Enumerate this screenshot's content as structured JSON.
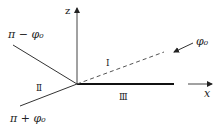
{
  "diagram": {
    "axes": {
      "z_label": "z",
      "x_label": "x"
    },
    "angle_labels": {
      "upper_left": "π − φ₀",
      "lower_left": "π + φ₀",
      "incident": "φ₀"
    },
    "regions": {
      "one": "Ⅰ",
      "two": "Ⅱ",
      "three": "Ⅲ"
    },
    "colors": {
      "line": "#222222",
      "text": "#222222",
      "dashed": "#555555"
    }
  }
}
